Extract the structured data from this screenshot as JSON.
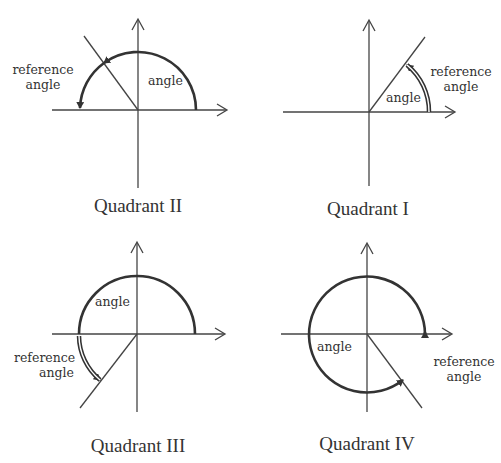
{
  "panels": [
    {
      "id": "q2",
      "title": "Quadrant II",
      "angle_label": "angle",
      "ref_label_line1": "reference",
      "ref_label_line2": "angle"
    },
    {
      "id": "q1",
      "title": "Quadrant I",
      "angle_label": "angle",
      "ref_label_line1": "reference",
      "ref_label_line2": "angle"
    },
    {
      "id": "q3",
      "title": "Quadrant III",
      "angle_label": "angle",
      "ref_label_line1": "reference",
      "ref_label_line2": "angle"
    },
    {
      "id": "q4",
      "title": "Quadrant IV",
      "angle_label": "angle",
      "ref_label_line1": "reference",
      "ref_label_line2": "angle"
    }
  ],
  "colors": {
    "stroke": "#3a3a3a",
    "text": "#333333",
    "background": "#ffffff"
  }
}
